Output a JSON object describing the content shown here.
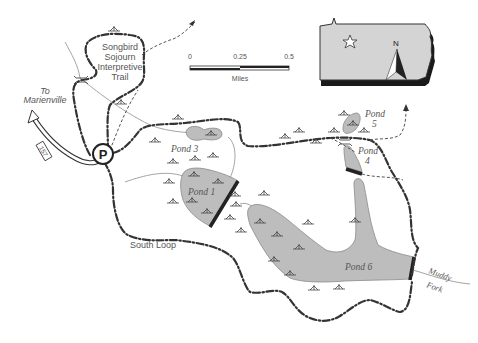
{
  "map": {
    "width": 478,
    "height": 343,
    "colors": {
      "background": "#ffffff",
      "pond_fill": "#bdbdbd",
      "trail": "#333333",
      "stream": "#9a9a9a",
      "dam": "#222222",
      "label": "#555555",
      "inset_fill": "#d4d4d4"
    }
  },
  "labels": {
    "songbird_trail": [
      "Songbird",
      "Sojourn",
      "Interpretive",
      "Trail"
    ],
    "to_town": [
      "To",
      "Marienville"
    ],
    "route_number": "157",
    "parking": "P",
    "south_loop": "South Loop",
    "stream_name": [
      "Muddy",
      "Fork"
    ]
  },
  "ponds": [
    {
      "id": "pond-1",
      "label": "Pond 1"
    },
    {
      "id": "pond-3",
      "label": "Pond 3"
    },
    {
      "id": "pond-4",
      "label": [
        "Pond",
        "4"
      ]
    },
    {
      "id": "pond-5",
      "label": [
        "Pond",
        "5"
      ]
    },
    {
      "id": "pond-6",
      "label": "Pond 6"
    }
  ],
  "scale_bar": {
    "ticks": [
      "0",
      "0.25",
      "0.5"
    ],
    "unit": "Miles"
  },
  "inset": {
    "north_label": "N",
    "location_marker": "star-icon"
  }
}
